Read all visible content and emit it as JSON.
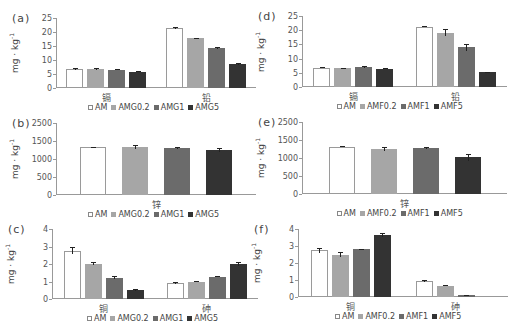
{
  "colors": {
    "s0": "#ffffff",
    "s1": "#a6a6a6",
    "s2": "#6b6b6b",
    "s3": "#333333",
    "border": "#9a9a9a"
  },
  "ylabel": "mg · kg",
  "ylabel_sup": "-1",
  "chart_data": [
    {
      "id": "a",
      "panel_label": "(a)",
      "type": "bar",
      "categories": [
        "镉",
        "铅"
      ],
      "series": [
        {
          "name": "AM",
          "values": [
            6.8,
            21.5
          ],
          "errors": [
            0.2,
            0.3
          ]
        },
        {
          "name": "AMG0.2",
          "values": [
            6.9,
            17.7
          ],
          "errors": [
            0.4,
            0.2
          ]
        },
        {
          "name": "AMG1",
          "values": [
            6.6,
            14.3
          ],
          "errors": [
            0.1,
            0.3
          ]
        },
        {
          "name": "AMG5",
          "values": [
            5.8,
            8.5
          ],
          "errors": [
            0.2,
            0.4
          ]
        }
      ],
      "yticks": [
        "0",
        "5",
        "10",
        "15",
        "20",
        "25"
      ],
      "ylim": [
        0,
        25
      ],
      "ylabel": "mg·kg-1",
      "legend_position": "bottom"
    },
    {
      "id": "b",
      "panel_label": "(b)",
      "type": "bar",
      "categories": [
        "锌"
      ],
      "series": [
        {
          "name": "AM",
          "values": [
            1650
          ],
          "errors": [
            20
          ]
        },
        {
          "name": "AMG0.2",
          "values": [
            1660
          ],
          "errors": [
            80
          ]
        },
        {
          "name": "AMG1",
          "values": [
            1640
          ],
          "errors": [
            40
          ]
        },
        {
          "name": "AMG5",
          "values": [
            1560
          ],
          "errors": [
            60
          ]
        }
      ],
      "yticks": [
        "0",
        "500",
        "1000",
        "1500",
        "2500"
      ],
      "ylim": [
        0,
        2500
      ],
      "ylabel": "mg·kg-1",
      "legend_position": "bottom"
    },
    {
      "id": "c",
      "panel_label": "(c)",
      "type": "bar",
      "categories": [
        "铜",
        "砷"
      ],
      "series": [
        {
          "name": "AM",
          "values": [
            2.75,
            0.92
          ],
          "errors": [
            0.2,
            0.05
          ]
        },
        {
          "name": "AMG0.2",
          "values": [
            2.02,
            1.0
          ],
          "errors": [
            0.1,
            0.05
          ]
        },
        {
          "name": "AMG1",
          "values": [
            1.22,
            1.27
          ],
          "errors": [
            0.1,
            0.03
          ]
        },
        {
          "name": "AMG5",
          "values": [
            0.52,
            2.0
          ],
          "errors": [
            0.05,
            0.1
          ]
        }
      ],
      "yticks": [
        "0",
        "1",
        "2",
        "3",
        "4"
      ],
      "ylim": [
        0,
        4
      ],
      "ylabel": "mg·kg-1",
      "legend_position": "bottom"
    },
    {
      "id": "d",
      "panel_label": "(d)",
      "type": "bar",
      "categories": [
        "镉",
        "铅"
      ],
      "series": [
        {
          "name": "AM",
          "values": [
            6.8,
            21.3
          ],
          "errors": [
            0.2,
            0.3
          ]
        },
        {
          "name": "AMF0.2",
          "values": [
            6.6,
            19.1
          ],
          "errors": [
            0.1,
            1.2
          ]
        },
        {
          "name": "AMF1",
          "values": [
            7.1,
            14.0
          ],
          "errors": [
            0.3,
            1.2
          ]
        },
        {
          "name": "AMF5",
          "values": [
            6.5,
            5.3
          ],
          "errors": [
            0.3,
            0.1
          ]
        }
      ],
      "yticks": [
        "0",
        "5",
        "10",
        "15",
        "20",
        "25"
      ],
      "ylim": [
        0,
        25
      ],
      "ylabel": "mg·kg-1",
      "legend_position": "bottom"
    },
    {
      "id": "e",
      "panel_label": "(e)",
      "type": "bar",
      "categories": [
        "锌"
      ],
      "series": [
        {
          "name": "AM",
          "values": [
            1640
          ],
          "errors": [
            15
          ]
        },
        {
          "name": "AMF0.2",
          "values": [
            1560
          ],
          "errors": [
            60
          ]
        },
        {
          "name": "AMF1",
          "values": [
            1590
          ],
          "errors": [
            30
          ]
        },
        {
          "name": "AMF5",
          "values": [
            1270
          ],
          "errors": [
            110
          ]
        }
      ],
      "yticks": [
        "0",
        "500",
        "1000",
        "1500",
        "2500"
      ],
      "ylim": [
        0,
        2500
      ],
      "ylabel": "mg·kg-1",
      "legend_position": "bottom"
    },
    {
      "id": "f",
      "panel_label": "(f)",
      "type": "bar",
      "categories": [
        "铜",
        "砷"
      ],
      "series": [
        {
          "name": "AM",
          "values": [
            2.75,
            0.93
          ],
          "errors": [
            0.15,
            0.05
          ]
        },
        {
          "name": "AMF0.2",
          "values": [
            2.5,
            0.65
          ],
          "errors": [
            0.15,
            0.03
          ]
        },
        {
          "name": "AMF1",
          "values": [
            2.8,
            0.1
          ],
          "errors": [
            0.03,
            0.03
          ]
        },
        {
          "name": "AMF5",
          "values": [
            3.65,
            0.0
          ],
          "errors": [
            0.1,
            0.0
          ]
        }
      ],
      "yticks": [
        "0",
        "1",
        "2",
        "3",
        "4"
      ],
      "ylim": [
        0,
        4
      ],
      "ylabel": "mg·kg-1",
      "legend_position": "bottom"
    }
  ]
}
